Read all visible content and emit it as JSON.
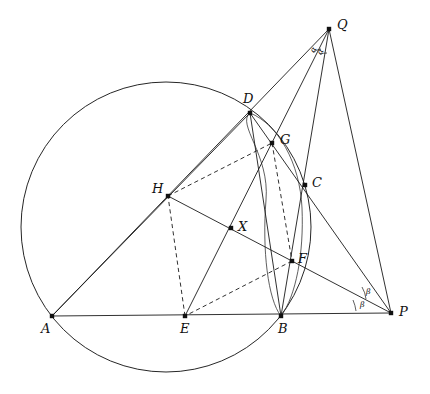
{
  "figure": {
    "width": 430,
    "height": 394,
    "background": "#ffffff",
    "ink": "#1a1a1a"
  },
  "points": {
    "A": {
      "label": "A",
      "x": 52,
      "y": 316,
      "label_x": 41,
      "label_y": 322
    },
    "B": {
      "label": "B",
      "x": 281,
      "y": 316,
      "label_x": 278,
      "label_y": 322
    },
    "C": {
      "label": "C",
      "x": 305,
      "y": 185,
      "label_x": 312,
      "label_y": 176
    },
    "D": {
      "label": "D",
      "x": 250,
      "y": 113,
      "label_x": 243,
      "label_y": 92
    },
    "E": {
      "label": "E",
      "x": 185,
      "y": 316,
      "label_x": 180,
      "label_y": 322
    },
    "F": {
      "label": "F",
      "x": 292,
      "y": 261,
      "label_x": 298,
      "label_y": 252
    },
    "G": {
      "label": "G",
      "x": 272,
      "y": 143,
      "label_x": 280,
      "label_y": 133
    },
    "H": {
      "label": "H",
      "x": 168,
      "y": 196,
      "label_x": 152,
      "label_y": 182
    },
    "X": {
      "label": "X",
      "x": 231,
      "y": 228,
      "label_x": 238,
      "label_y": 220
    },
    "P": {
      "label": "P",
      "x": 391,
      "y": 313,
      "label_x": 399,
      "label_y": 305
    },
    "Q": {
      "label": "Q",
      "x": 329,
      "y": 29,
      "label_x": 337,
      "label_y": 18
    }
  },
  "angles": [
    {
      "name": "alpha-1",
      "label": "α",
      "x": 311,
      "y": 46
    },
    {
      "name": "alpha-2",
      "label": "α",
      "x": 318,
      "y": 48
    },
    {
      "name": "beta-1",
      "label": "β",
      "x": 366,
      "y": 292
    },
    {
      "name": "beta-2",
      "label": "β",
      "x": 362,
      "y": 303
    }
  ],
  "circles": [
    {
      "name": "circumcircle-ABCD",
      "cx": 166,
      "cy": 227,
      "r": 145,
      "style": "solid",
      "through": [
        "A",
        "B",
        "D",
        "C"
      ]
    },
    {
      "name": "secondary-circle-DGFB",
      "cx": 240,
      "cy": 244,
      "r": 133,
      "style": "solid",
      "through": [
        "D",
        "G",
        "F",
        "B"
      ]
    }
  ],
  "segments": [
    {
      "name": "segment-A-P",
      "from": "A",
      "to": "P",
      "style": "solid"
    },
    {
      "name": "segment-A-Q",
      "from": "A",
      "to": "Q",
      "style": "solid"
    },
    {
      "name": "segment-Q-B",
      "from": "Q",
      "to": "B",
      "style": "solid"
    },
    {
      "name": "segment-Q-P",
      "from": "Q",
      "to": "P",
      "style": "solid"
    },
    {
      "name": "segment-Q-E",
      "from": "Q",
      "to": "E",
      "style": "solid"
    },
    {
      "name": "segment-D-P",
      "from": "D",
      "to": "P",
      "style": "solid"
    },
    {
      "name": "segment-H-P",
      "from": "H",
      "to": "P",
      "style": "solid"
    },
    {
      "name": "segment-A-D",
      "from": "A",
      "to": "D",
      "style": "solid"
    },
    {
      "name": "segment-D-B",
      "from": "D",
      "to": "B",
      "style": "solid"
    },
    {
      "name": "segment-H-E",
      "from": "H",
      "to": "E",
      "style": "dashed"
    },
    {
      "name": "segment-H-G",
      "from": "H",
      "to": "G",
      "style": "dashed"
    },
    {
      "name": "segment-G-F",
      "from": "G",
      "to": "F",
      "style": "dashed"
    },
    {
      "name": "segment-E-F",
      "from": "E",
      "to": "F",
      "style": "dashed"
    },
    {
      "name": "segment-H-F",
      "from": "H",
      "to": "F",
      "style": "solid"
    }
  ],
  "vertex_order": [
    "A",
    "B",
    "C",
    "D",
    "E",
    "F",
    "G",
    "H",
    "X",
    "P",
    "Q"
  ]
}
